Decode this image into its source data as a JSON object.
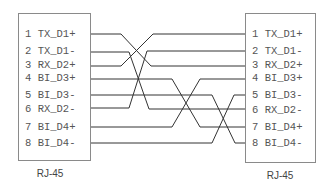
{
  "diagram": {
    "left_connector": {
      "label": "RJ-45",
      "pins": [
        {
          "num": "1",
          "name": "TX_D1+"
        },
        {
          "num": "2",
          "name": "TX_D1-"
        },
        {
          "num": "3",
          "name": "RX_D2+"
        },
        {
          "num": "4",
          "name": "BI_D3+"
        },
        {
          "num": "5",
          "name": "BI_D3-"
        },
        {
          "num": "6",
          "name": "RX_D2-"
        },
        {
          "num": "7",
          "name": "BI_D4+"
        },
        {
          "num": "8",
          "name": "BI_D4-"
        }
      ]
    },
    "right_connector": {
      "label": "RJ-45",
      "pins": [
        {
          "num": "1",
          "name": "TX_D1+"
        },
        {
          "num": "2",
          "name": "TX_D1-"
        },
        {
          "num": "3",
          "name": "RX_D2+"
        },
        {
          "num": "4",
          "name": "BI_D3+"
        },
        {
          "num": "5",
          "name": "BI_D3-"
        },
        {
          "num": "6",
          "name": "RX_D2-"
        },
        {
          "num": "7",
          "name": "BI_D4+"
        },
        {
          "num": "8",
          "name": "BI_D4-"
        }
      ]
    },
    "connections": [
      {
        "from": 1,
        "to": 3
      },
      {
        "from": 2,
        "to": 6
      },
      {
        "from": 3,
        "to": 1
      },
      {
        "from": 4,
        "to": 7
      },
      {
        "from": 5,
        "to": 8
      },
      {
        "from": 6,
        "to": 2
      },
      {
        "from": 7,
        "to": 4
      },
      {
        "from": 8,
        "to": 5
      }
    ],
    "colors": {
      "wire": "#333333",
      "box_border": "#8a8a8a",
      "text": "#555555"
    }
  }
}
